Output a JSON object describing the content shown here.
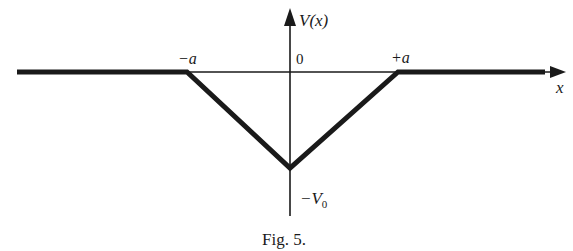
{
  "figure": {
    "caption": "Fig. 5.",
    "type": "potential-well-diagram",
    "colors": {
      "ink": "#1a1a1a",
      "background": "#ffffff"
    }
  },
  "axes": {
    "y_label": "V(x)",
    "x_label": "x",
    "origin_label": "0"
  },
  "tick_labels": {
    "neg_a": "−a",
    "pos_a": "+a",
    "neg_v0_prefix": "−V",
    "neg_v0_sub": "0"
  },
  "curve": {
    "description": "Triangular potential well: V=0 for |x|>a, linear down to -V0 at x=0",
    "points": [
      {
        "x": "-inf",
        "V": 0
      },
      {
        "x": "-a",
        "V": 0
      },
      {
        "x": "0",
        "V": "-V0"
      },
      {
        "x": "+a",
        "V": 0
      },
      {
        "x": "+inf",
        "V": 0
      }
    ]
  }
}
